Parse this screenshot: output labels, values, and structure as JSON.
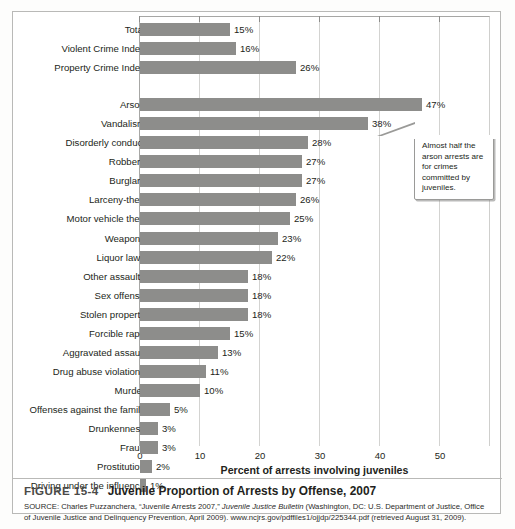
{
  "figure": {
    "number": "FIGURE 15-4",
    "title": "Juvenile Proportion of Arrests by Offense, 2007",
    "source_prefix": "SOURCE: Charles Puzzanchera, “Juvenile Arrests 2007,” ",
    "source_italic": "Juvenile Justice Bulletin",
    "source_suffix": " (Washington, DC: U.S. Department of Justice, Office of Juvenile Justice and Delinquency Prevention, April 2009). www.ncjrs.gov/pdffiles1/ojjdp/225344.pdf (retrieved August 31, 2009)."
  },
  "callout": {
    "text": "Almost half the arson arrests are for crimes committed by juveniles."
  },
  "colors": {
    "bar": "#8d8d8b",
    "gridline": "#d3d3d1",
    "panel_border": "#b9b9b7",
    "text": "#231f20"
  },
  "chart_data": {
    "type": "bar",
    "orientation": "horizontal",
    "title": "Juvenile Proportion of Arrests by Offense, 2007",
    "xlabel": "Percent of arrests involving juveniles",
    "ylabel": "",
    "xlim": [
      0,
      55
    ],
    "xticks": [
      0,
      10,
      20,
      30,
      40,
      50
    ],
    "xtick_labels": [
      "0",
      "10",
      "20",
      "30",
      "40",
      "50"
    ],
    "grid": true,
    "legend": null,
    "value_suffix": "%",
    "groups": [
      {
        "name": "summary",
        "categories": [
          "Total",
          "Violent Crime Index",
          "Property Crime Index"
        ],
        "values": [
          15,
          16,
          26
        ],
        "value_labels": [
          "15%",
          "16%",
          "26%"
        ]
      },
      {
        "name": "offenses",
        "categories": [
          "Arson",
          "Vandalism",
          "Disorderly conduct",
          "Robbery",
          "Burglary",
          "Larceny-theft",
          "Motor vehicle theft",
          "Weapons",
          "Liquor laws",
          "Other assaults",
          "Sex offense",
          "Stolen property",
          "Forcible rape",
          "Aggravated assault",
          "Drug abuse violations",
          "Murder",
          "Offenses against the family",
          "Drunkenness",
          "Fraud",
          "Prostitution",
          "Driving under the influence"
        ],
        "values": [
          47,
          38,
          28,
          27,
          27,
          26,
          25,
          23,
          22,
          18,
          18,
          18,
          15,
          13,
          11,
          10,
          5,
          3,
          3,
          2,
          1
        ],
        "value_labels": [
          "47%",
          "38%",
          "28%",
          "27%",
          "27%",
          "26%",
          "25%",
          "23%",
          "22%",
          "18%",
          "18%",
          "18%",
          "15%",
          "13%",
          "11%",
          "10%",
          "5%",
          "3%",
          "3%",
          "2%",
          "1%"
        ]
      }
    ],
    "categories": [
      "Total",
      "Violent Crime Index",
      "Property Crime Index",
      "Arson",
      "Vandalism",
      "Disorderly conduct",
      "Robbery",
      "Burglary",
      "Larceny-theft",
      "Motor vehicle theft",
      "Weapons",
      "Liquor laws",
      "Other assaults",
      "Sex offense",
      "Stolen property",
      "Forcible rape",
      "Aggravated assault",
      "Drug abuse violations",
      "Murder",
      "Offenses against the family",
      "Drunkenness",
      "Fraud",
      "Prostitution",
      "Driving under the influence"
    ],
    "values": [
      15,
      16,
      26,
      47,
      38,
      28,
      27,
      27,
      26,
      25,
      23,
      22,
      18,
      18,
      18,
      15,
      13,
      11,
      10,
      5,
      3,
      3,
      2,
      1
    ]
  }
}
